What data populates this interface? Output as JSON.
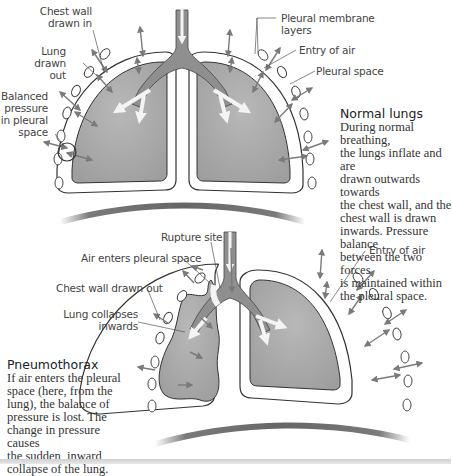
{
  "normal": {
    "labels": {
      "chest_wall_drawn_in_1": "Chest wall",
      "chest_wall_drawn_in_2": "drawn in",
      "lung_drawn_out_1": "Lung",
      "lung_drawn_out_2": "drawn out",
      "balanced_1": "Balanced",
      "balanced_2": "pressure",
      "balanced_3": "in pleural",
      "balanced_4": "space",
      "pleural_membrane_1": "Pleural membrane",
      "pleural_membrane_2": "layers",
      "entry_of_air": "Entry of air",
      "pleural_space": "Pleural space"
    },
    "title": "Normal lungs",
    "description_lines": [
      "During normal breathing,",
      "the lungs inflate and are",
      "drawn outwards towards",
      "the chest wall, and the",
      "chest wall is drawn",
      "inwards. Pressure balance",
      "between the two forces",
      "is maintained within",
      "the pleural space."
    ]
  },
  "pneumothorax": {
    "labels": {
      "rupture_site": "Rupture site",
      "air_enters": "Air enters pleural space",
      "chest_wall_drawn_out": "Chest wall drawn out",
      "lung_collapses_1": "Lung collapses",
      "lung_collapses_2": "inwards",
      "entry_of_air": "Entry of air"
    },
    "title": "Pneumothorax",
    "description_lines": [
      "If air enters the pleural",
      "space (here, from the",
      "lung), the balance of",
      "pressure is lost. The",
      "change in pressure causes",
      "the sudden, inward",
      "collapse of the lung."
    ]
  },
  "colors": {
    "lung_fill": "#a9a9a9",
    "airway_fill": "#8f8f8f",
    "outline": "#333333",
    "arrow": "#7a7a7a",
    "diaphragm": "#6e6e6e"
  }
}
